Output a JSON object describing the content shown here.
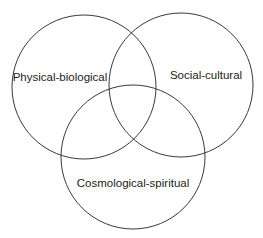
{
  "diagram": {
    "type": "venn",
    "stroke_color": "#3a3a3a",
    "text_color": "#222222",
    "sets": [
      {
        "id": "physical-biological",
        "label": "Physical-biological",
        "cx": 84,
        "cy": 87,
        "r": 72,
        "label_x": 60,
        "label_y": 81
      },
      {
        "id": "social-cultural",
        "label": "Social-cultural",
        "cx": 181,
        "cy": 85,
        "r": 72,
        "label_x": 206,
        "label_y": 79
      },
      {
        "id": "cosmological-spiritual",
        "label": "Cosmological-spiritual",
        "cx": 133,
        "cy": 157,
        "r": 72,
        "label_x": 133,
        "label_y": 187
      }
    ]
  }
}
